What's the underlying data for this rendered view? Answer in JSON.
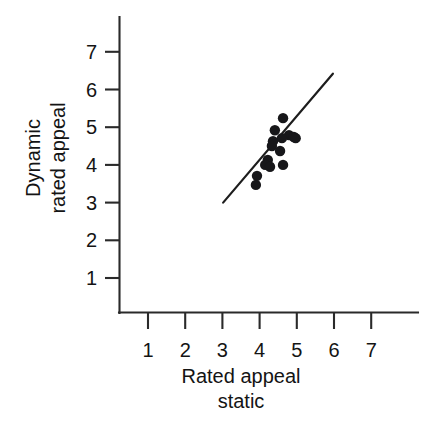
{
  "chart_data": {
    "type": "scatter",
    "title": "",
    "xlabel": "Rated appeal static",
    "xlabel_lines": [
      "Rated appeal",
      "static"
    ],
    "ylabel": "Dynamic rated appeal",
    "ylabel_lines": [
      "Dynamic",
      "rated appeal"
    ],
    "xlim": [
      0.25,
      7.9
    ],
    "ylim": [
      0.0,
      7.65
    ],
    "xticks": [
      1,
      2,
      3,
      4,
      5,
      6,
      7
    ],
    "yticks": [
      1,
      2,
      3,
      4,
      5,
      6,
      7
    ],
    "xticklabels": [
      "1",
      "2",
      "3",
      "4",
      "5",
      "6",
      "7"
    ],
    "yticklabels": [
      "1",
      "2",
      "3",
      "4",
      "5",
      "6",
      "7"
    ],
    "grid": false,
    "legend": null,
    "point_color": "#17171a",
    "line_color": "#1d1d1d",
    "axis_color": "#2a2a2a",
    "marker_size_px": 5.2,
    "points": [
      {
        "x": 4.63,
        "y": 5.24
      },
      {
        "x": 4.41,
        "y": 4.92
      },
      {
        "x": 4.79,
        "y": 4.79
      },
      {
        "x": 4.92,
        "y": 4.74
      },
      {
        "x": 4.97,
        "y": 4.71
      },
      {
        "x": 4.6,
        "y": 4.71
      },
      {
        "x": 4.36,
        "y": 4.63
      },
      {
        "x": 4.33,
        "y": 4.5
      },
      {
        "x": 4.55,
        "y": 4.37
      },
      {
        "x": 4.22,
        "y": 4.13
      },
      {
        "x": 4.15,
        "y": 4.0
      },
      {
        "x": 4.28,
        "y": 3.95
      },
      {
        "x": 4.63,
        "y": 4.0
      },
      {
        "x": 3.93,
        "y": 3.71
      },
      {
        "x": 3.9,
        "y": 3.47
      }
    ],
    "fit_line": {
      "label": "regression line",
      "x0": 3.02,
      "y0": 3.0,
      "x1": 5.97,
      "y1": 6.42
    }
  }
}
